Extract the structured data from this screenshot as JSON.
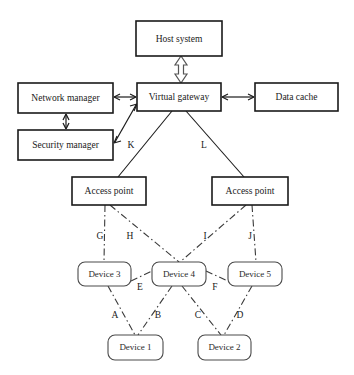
{
  "diagram": {
    "background_color": "#ffffff",
    "line_color": "#1a1a1a",
    "nodes": {
      "host_system": {
        "label": "Host system",
        "shape": "rectangle",
        "x": 136,
        "y": 21,
        "w": 86,
        "h": 35
      },
      "network_manager": {
        "label": "Network manager",
        "shape": "rectangle",
        "x": 18,
        "y": 83,
        "w": 95,
        "h": 30
      },
      "security_manager": {
        "label": "Security manager",
        "shape": "rectangle",
        "x": 18,
        "y": 130,
        "w": 95,
        "h": 30
      },
      "virtual_gateway": {
        "label": "Virtual gateway",
        "shape": "rectangle",
        "x": 137,
        "y": 83,
        "w": 84,
        "h": 28
      },
      "data_cache": {
        "label": "Data cache",
        "shape": "rectangle",
        "x": 255,
        "y": 83,
        "w": 83,
        "h": 28
      },
      "access_point_left": {
        "label": "Access point",
        "shape": "rectangle",
        "x": 72,
        "y": 177,
        "w": 74,
        "h": 28
      },
      "access_point_right": {
        "label": "Access point",
        "shape": "rectangle",
        "x": 212,
        "y": 177,
        "w": 76,
        "h": 28
      },
      "device_3": {
        "label": "Device 3",
        "shape": "rounded",
        "x": 78,
        "y": 262,
        "w": 53,
        "h": 24
      },
      "device_4": {
        "label": "Device 4",
        "shape": "rounded",
        "x": 152,
        "y": 262,
        "w": 54,
        "h": 24
      },
      "device_5": {
        "label": "Device 5",
        "shape": "rounded",
        "x": 228,
        "y": 262,
        "w": 54,
        "h": 24
      },
      "device_1": {
        "label": "Device 1",
        "shape": "rounded",
        "x": 108,
        "y": 335,
        "w": 55,
        "h": 25
      },
      "device_2": {
        "label": "Device 2",
        "shape": "rounded",
        "x": 198,
        "y": 335,
        "w": 53,
        "h": 25
      }
    },
    "edge_labels": {
      "a": "A",
      "b": "B",
      "c": "C",
      "d": "D",
      "e": "E",
      "f": "F",
      "g": "G",
      "h": "H",
      "i": "I",
      "j": "J",
      "k": "K",
      "l": "L"
    },
    "links": [
      {
        "from": "host_system",
        "to": "virtual_gateway",
        "style": "hollow-double-arrow"
      },
      {
        "from": "network_manager",
        "to": "virtual_gateway",
        "style": "double-arrow"
      },
      {
        "from": "virtual_gateway",
        "to": "data_cache",
        "style": "double-arrow"
      },
      {
        "from": "network_manager",
        "to": "security_manager",
        "style": "double-arrow"
      },
      {
        "from": "security_manager",
        "to": "virtual_gateway",
        "style": "double-arrow"
      },
      {
        "from": "virtual_gateway",
        "to": "access_point_left",
        "style": "solid",
        "label": "K"
      },
      {
        "from": "virtual_gateway",
        "to": "access_point_right",
        "style": "solid",
        "label": "L"
      },
      {
        "from": "access_point_left",
        "to": "device_3",
        "style": "dash-dot",
        "label": "G"
      },
      {
        "from": "access_point_left",
        "to": "device_4",
        "style": "dash-dot",
        "label": "H"
      },
      {
        "from": "access_point_right",
        "to": "device_4",
        "style": "dash-dot",
        "label": "I"
      },
      {
        "from": "access_point_right",
        "to": "device_5",
        "style": "dash-dot",
        "label": "J"
      },
      {
        "from": "device_3",
        "to": "device_4",
        "style": "dash-dot",
        "label": "E"
      },
      {
        "from": "device_4",
        "to": "device_5",
        "style": "dash-dot",
        "label": "F"
      },
      {
        "from": "device_3",
        "to": "device_1",
        "style": "dash-dot",
        "label": "A"
      },
      {
        "from": "device_4",
        "to": "device_1",
        "style": "dash-dot",
        "label": "B"
      },
      {
        "from": "device_4",
        "to": "device_2",
        "style": "dash-dot",
        "label": "C"
      },
      {
        "from": "device_5",
        "to": "device_2",
        "style": "dash-dot",
        "label": "D"
      }
    ]
  }
}
